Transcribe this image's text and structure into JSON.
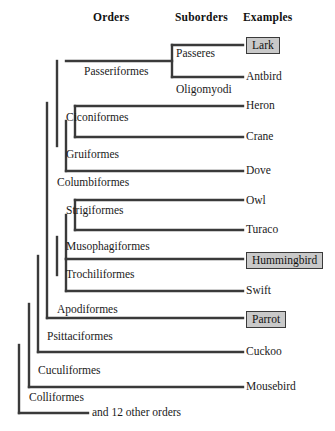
{
  "figure": {
    "width": 335,
    "height": 431,
    "background": "#ffffff",
    "line_color": "#3a3a3a",
    "box_fill": "#c9c9c9",
    "box_border": "#3a3a3a",
    "text_color": "#1a1a1a"
  },
  "headers": [
    {
      "label": "Orders",
      "x": 93,
      "y": 11
    },
    {
      "label": "Suborders",
      "x": 175,
      "y": 11
    },
    {
      "label": "Examples",
      "x": 243,
      "y": 11
    }
  ],
  "suborders": [
    {
      "label": "Passeres",
      "x": 176,
      "y": 47
    },
    {
      "label": "Oligomyodi",
      "x": 176,
      "y": 83
    }
  ],
  "orders": [
    {
      "label": "Passeriformes",
      "x": 84,
      "y": 65
    },
    {
      "label": "Ciconiformes",
      "x": 66,
      "y": 111
    },
    {
      "label": "Gruiformes",
      "x": 66,
      "y": 148
    },
    {
      "label": "Columbiformes",
      "x": 57,
      "y": 176
    },
    {
      "label": "Strigiformes",
      "x": 66,
      "y": 204
    },
    {
      "label": "Musophagiformes",
      "x": 66,
      "y": 240
    },
    {
      "label": "Trochiliformes",
      "x": 66,
      "y": 268
    },
    {
      "label": "Apodiformes",
      "x": 57,
      "y": 303
    },
    {
      "label": "Psittaciformes",
      "x": 47,
      "y": 330
    },
    {
      "label": "Cuculiformes",
      "x": 38,
      "y": 364
    },
    {
      "label": "Colliformes",
      "x": 29,
      "y": 391
    }
  ],
  "tips": [
    {
      "label": "Lark",
      "x": 246,
      "y": 37,
      "boxed": true
    },
    {
      "label": "Antbird",
      "x": 246,
      "y": 70,
      "boxed": false
    },
    {
      "label": "Heron",
      "x": 246,
      "y": 99,
      "boxed": false
    },
    {
      "label": "Crane",
      "x": 246,
      "y": 130,
      "boxed": false
    },
    {
      "label": "Dove",
      "x": 246,
      "y": 164,
      "boxed": false
    },
    {
      "label": "Owl",
      "x": 246,
      "y": 194,
      "boxed": false
    },
    {
      "label": "Turaco",
      "x": 246,
      "y": 223,
      "boxed": false
    },
    {
      "label": "Hummingbird",
      "x": 246,
      "y": 252,
      "boxed": true
    },
    {
      "label": "Swift",
      "x": 246,
      "y": 284,
      "boxed": false
    },
    {
      "label": "Parrot",
      "x": 246,
      "y": 311,
      "boxed": true
    },
    {
      "label": "Cuckoo",
      "x": 246,
      "y": 345,
      "boxed": false
    },
    {
      "label": "Mousebird",
      "x": 246,
      "y": 380,
      "boxed": false
    },
    {
      "label": "and 12 other orders",
      "x": 92,
      "y": 406,
      "boxed": false
    }
  ],
  "tree_geometry": {
    "stroke_width": 2.4,
    "tip_x": 243,
    "root_tip_x": 88,
    "backbone_x": [
      19,
      29,
      38,
      47,
      57,
      66
    ],
    "horizontals": [
      {
        "x1": 172,
        "x2": 243,
        "y": 45,
        "name": "branch-passeres-lark"
      },
      {
        "x1": 172,
        "x2": 243,
        "y": 77,
        "name": "branch-oligomyodi-antbird"
      },
      {
        "x1": 66,
        "x2": 172,
        "y": 61,
        "name": "branch-passeriformes"
      },
      {
        "x1": 75,
        "x2": 243,
        "y": 106,
        "name": "branch-ciconiformes-heron"
      },
      {
        "x1": 75,
        "x2": 243,
        "y": 137,
        "name": "branch-gruiformes-crane"
      },
      {
        "x1": 66,
        "x2": 243,
        "y": 171,
        "name": "branch-columbiformes-dove"
      },
      {
        "x1": 75,
        "x2": 243,
        "y": 200,
        "name": "branch-strigiformes-owl"
      },
      {
        "x1": 75,
        "x2": 243,
        "y": 230,
        "name": "branch-musophagiformes-turaco"
      },
      {
        "x1": 66,
        "x2": 243,
        "y": 259,
        "name": "branch-trochiliformes-hummingbird"
      },
      {
        "x1": 66,
        "x2": 243,
        "y": 291,
        "name": "branch-apodiformes-swift"
      },
      {
        "x1": 47,
        "x2": 243,
        "y": 318,
        "name": "branch-psittaciformes-parrot"
      },
      {
        "x1": 38,
        "x2": 243,
        "y": 352,
        "name": "branch-cuculiformes-cuckoo"
      },
      {
        "x1": 29,
        "x2": 243,
        "y": 387,
        "name": "branch-colliformes-mousebird"
      },
      {
        "x1": 19,
        "x2": 88,
        "y": 413,
        "name": "branch-other-orders"
      }
    ],
    "verticals": [
      {
        "x": 172,
        "y1": 45,
        "y2": 77,
        "name": "node-passeriformes-split"
      },
      {
        "x": 75,
        "y1": 106,
        "y2": 137,
        "name": "node-ciconiformes-gruiformes"
      },
      {
        "x": 66,
        "y1": 121,
        "y2": 171,
        "name": "node-columbiformes-clade"
      },
      {
        "x": 57,
        "y1": 61,
        "y2": 146,
        "name": "node-passeriformes-waterbirds"
      },
      {
        "x": 75,
        "y1": 200,
        "y2": 230,
        "name": "node-strigiformes-musophagiformes"
      },
      {
        "x": 66,
        "y1": 215,
        "y2": 259,
        "name": "node-owl-turaco-clade"
      },
      {
        "x": 66,
        "y1": 259,
        "y2": 291,
        "name": "node-trochiliformes-apodiformes"
      },
      {
        "x": 57,
        "y1": 237,
        "y2": 275,
        "name": "node-apodiform-clade"
      },
      {
        "x": 47,
        "y1": 103,
        "y2": 318,
        "name": "node-core-landbirds"
      },
      {
        "x": 38,
        "y1": 256,
        "y2": 352,
        "name": "node-psittaciformes-clade"
      },
      {
        "x": 29,
        "y1": 304,
        "y2": 387,
        "name": "node-cuculiformes-clade"
      },
      {
        "x": 19,
        "y1": 345,
        "y2": 413,
        "name": "node-root"
      }
    ]
  }
}
